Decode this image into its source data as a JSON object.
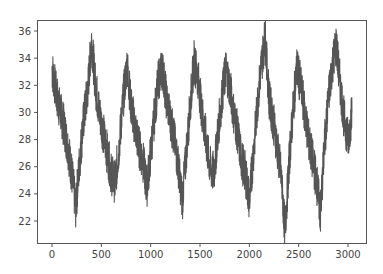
{
  "chart_data": {
    "type": "line",
    "title": "",
    "xlabel": "",
    "ylabel": "",
    "xlim": [
      -150,
      3200
    ],
    "ylim": [
      20.7,
      36.7
    ],
    "grid": false,
    "legend": null,
    "x_ticks": [
      0,
      500,
      1000,
      1500,
      2000,
      2500,
      3000
    ],
    "y_ticks": [
      22,
      24,
      26,
      28,
      30,
      32,
      34,
      36
    ],
    "line_color": "#555555",
    "series": [
      {
        "name": "series",
        "description": "noisy periodic signal, ~7 cycles over ~3050 samples",
        "x": [
          0,
          40,
          80,
          120,
          160,
          200,
          240,
          280,
          320,
          360,
          400,
          440,
          480,
          520,
          560,
          600,
          640,
          680,
          720,
          760,
          800,
          840,
          880,
          920,
          960,
          1000,
          1040,
          1080,
          1120,
          1160,
          1200,
          1240,
          1280,
          1320,
          1360,
          1400,
          1440,
          1480,
          1520,
          1560,
          1600,
          1640,
          1680,
          1720,
          1760,
          1800,
          1840,
          1880,
          1920,
          1960,
          2000,
          2040,
          2080,
          2120,
          2160,
          2200,
          2240,
          2280,
          2320,
          2360,
          2400,
          2440,
          2480,
          2520,
          2560,
          2600,
          2640,
          2680,
          2720,
          2760,
          2800,
          2840,
          2880,
          2920,
          2960,
          3000,
          3040
        ],
        "values": [
          33.2,
          31.5,
          30.2,
          29.0,
          27.5,
          25.5,
          23.0,
          26.5,
          29.5,
          31.5,
          35.3,
          32.0,
          30.0,
          28.5,
          27.0,
          25.5,
          24.8,
          27.5,
          31.0,
          33.5,
          30.5,
          29.0,
          27.5,
          26.5,
          24.5,
          27.0,
          30.0,
          32.5,
          33.2,
          31.0,
          29.5,
          28.0,
          26.0,
          23.5,
          27.0,
          30.5,
          33.8,
          32.5,
          30.0,
          28.0,
          26.0,
          25.5,
          28.5,
          31.0,
          33.2,
          32.0,
          30.0,
          28.5,
          26.5,
          25.5,
          23.5,
          27.0,
          30.5,
          33.5,
          35.6,
          31.0,
          29.5,
          27.5,
          25.5,
          21.3,
          26.0,
          30.0,
          33.3,
          32.0,
          30.0,
          28.0,
          26.5,
          25.0,
          22.5,
          27.5,
          31.0,
          33.5,
          35.0,
          32.0,
          29.5,
          28.0,
          30.0
        ]
      }
    ]
  }
}
